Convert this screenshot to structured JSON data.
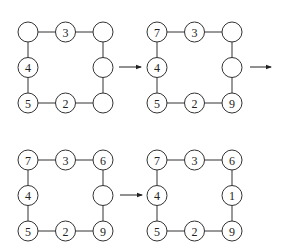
{
  "diagram": {
    "colors": {
      "stroke": "#333333",
      "text": "#222222",
      "background": "#ffffff"
    },
    "panels": [
      {
        "id": "step-1",
        "origin": [
          28,
          32
        ],
        "nodes": {
          "top_left": "",
          "top_mid": "3",
          "top_right": "",
          "mid_left": "4",
          "mid_right": "",
          "bot_left": "5",
          "bot_mid": "2",
          "bot_right": ""
        }
      },
      {
        "id": "step-2",
        "origin": [
          157,
          32
        ],
        "nodes": {
          "top_left": "7",
          "top_mid": "3",
          "top_right": "",
          "mid_left": "4",
          "mid_right": "",
          "bot_left": "5",
          "bot_mid": "2",
          "bot_right": "9"
        }
      },
      {
        "id": "step-3",
        "origin": [
          28,
          160
        ],
        "nodes": {
          "top_left": "7",
          "top_mid": "3",
          "top_right": "6",
          "mid_left": "4",
          "mid_right": "",
          "bot_left": "5",
          "bot_mid": "2",
          "bot_right": "9"
        }
      },
      {
        "id": "step-4",
        "origin": [
          157,
          160
        ],
        "nodes": {
          "top_left": "7",
          "top_mid": "3",
          "top_right": "6",
          "mid_left": "4",
          "mid_right": "1",
          "bot_left": "5",
          "bot_mid": "2",
          "bot_right": "9"
        }
      }
    ],
    "arrows": [
      {
        "from": [
          119,
          67
        ],
        "to": [
          141,
          67
        ]
      },
      {
        "from": [
          250,
          67
        ],
        "to": [
          271,
          67
        ]
      },
      {
        "from": [
          120,
          195
        ],
        "to": [
          142,
          195
        ]
      }
    ]
  }
}
